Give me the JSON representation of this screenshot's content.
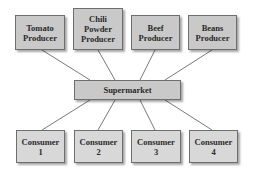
{
  "diagram": {
    "producers": [
      {
        "label": "Tomato\nProducer"
      },
      {
        "label": "Chili\nPowder\nProducer"
      },
      {
        "label": "Beef\nProducer"
      },
      {
        "label": "Beans\nProducer"
      }
    ],
    "hub": {
      "label": "Supermarket"
    },
    "consumers": [
      {
        "label": "Consumer\n1"
      },
      {
        "label": "Consumer\n2"
      },
      {
        "label": "Consumer\n3"
      },
      {
        "label": "Consumer\n4"
      }
    ],
    "colors": {
      "box_fill": "#c9c9c9",
      "consumer_fill": "#d8d8d8",
      "border": "#6e6e6e",
      "line": "#555555"
    }
  }
}
